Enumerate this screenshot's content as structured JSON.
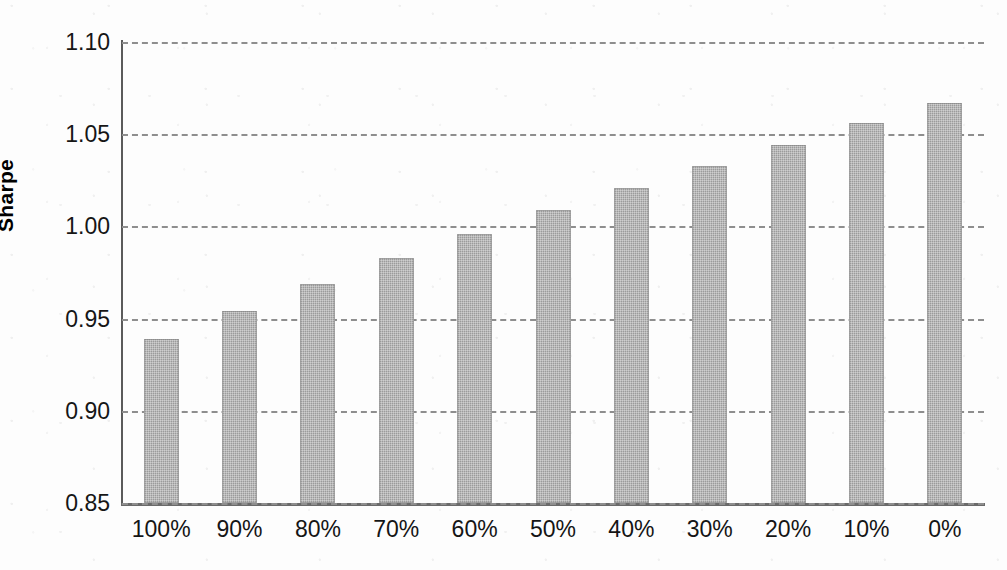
{
  "chart_data": {
    "type": "bar",
    "title": "",
    "xlabel": "",
    "ylabel": "Sharpe",
    "categories": [
      "100%",
      "90%",
      "80%",
      "70%",
      "60%",
      "50%",
      "40%",
      "30%",
      "20%",
      "10%",
      "0%"
    ],
    "values": [
      0.939,
      0.954,
      0.969,
      0.983,
      0.996,
      1.009,
      1.021,
      1.033,
      1.044,
      1.056,
      1.067
    ],
    "ylim": [
      0.85,
      1.1
    ],
    "yticks": [
      "0.85",
      "0.90",
      "0.95",
      "1.00",
      "1.05",
      "1.10"
    ],
    "ytick_values": [
      0.85,
      0.9,
      0.95,
      1.0,
      1.05,
      1.1
    ],
    "grid": true,
    "grid_style": "dashed-horizontal",
    "legend": "none",
    "bar_color": "#9b9b9b",
    "axis_color": "#5b5b5b",
    "gridline_color": "#8e8e8e",
    "text_color": "#161616"
  }
}
